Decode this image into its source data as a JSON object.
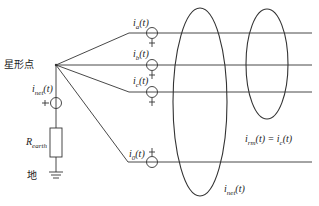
{
  "diagram": {
    "type": "circuit",
    "labels": {
      "star_point": "星形点",
      "ground": "地",
      "i_net": "i",
      "i_net_sub": "net",
      "i_net_arg": "(t)",
      "r_earth": "R",
      "r_earth_sub": "earth",
      "i_a": "i",
      "i_a_sub": "a",
      "i_a_arg": "(t)",
      "i_b": "i",
      "i_b_sub": "b",
      "i_b_arg": "(t)",
      "i_c": "i",
      "i_c_sub": "c",
      "i_c_arg": "(t)",
      "i_0": "i",
      "i_0_sub": "0",
      "i_0_arg": "(t)",
      "i_rm_eq": "i",
      "i_rm_sub": "rm",
      "i_rm_rhs": "(t) = i",
      "i_rm_rhs_sub": "c",
      "i_rm_rhs_arg": "(t)",
      "i_net_loop": "i",
      "i_net_loop_sub": "net",
      "i_net_loop_arg": "(t)"
    },
    "colors": {
      "line": "#333333",
      "background": "#ffffff"
    }
  }
}
